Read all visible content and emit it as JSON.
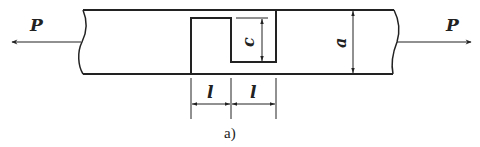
{
  "diagram": {
    "type": "mechanics-schematic",
    "colors": {
      "stroke": "#222222",
      "background": "#ffffff"
    },
    "labels": {
      "force_left": "P",
      "force_right": "P",
      "notch_depth": "c",
      "bar_height": "a",
      "length_left": "l",
      "length_right": "l",
      "caption": "a)"
    }
  }
}
